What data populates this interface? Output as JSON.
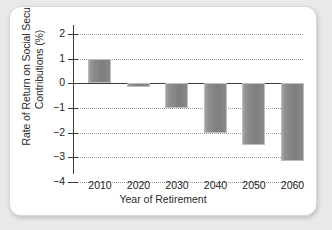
{
  "chart_data": {
    "type": "bar",
    "title": "",
    "xlabel": "Year of Retirement",
    "ylabel": "Rate of Return on Social Security Contributions (%)",
    "categories": [
      "2010",
      "2020",
      "2030",
      "2040",
      "2050",
      "2060"
    ],
    "values": [
      1.0,
      -0.15,
      -1.0,
      -2.0,
      -2.5,
      -3.15
    ],
    "ylim": [
      -4,
      2
    ],
    "yticks": [
      "2",
      "1",
      "0",
      "−1",
      "−2",
      "−3",
      "−4"
    ],
    "ytick_values": [
      2,
      1,
      0,
      -1,
      -2,
      -3,
      -4
    ],
    "grid": "horizontal-dotted",
    "legend": "none",
    "bar_color": "#8a8a8a",
    "zero_line_color": "#3a3a3a",
    "grid_color": "#9a9a9a"
  },
  "figure": {
    "background": "#ffffff",
    "page_background": "#e9e9e9"
  }
}
